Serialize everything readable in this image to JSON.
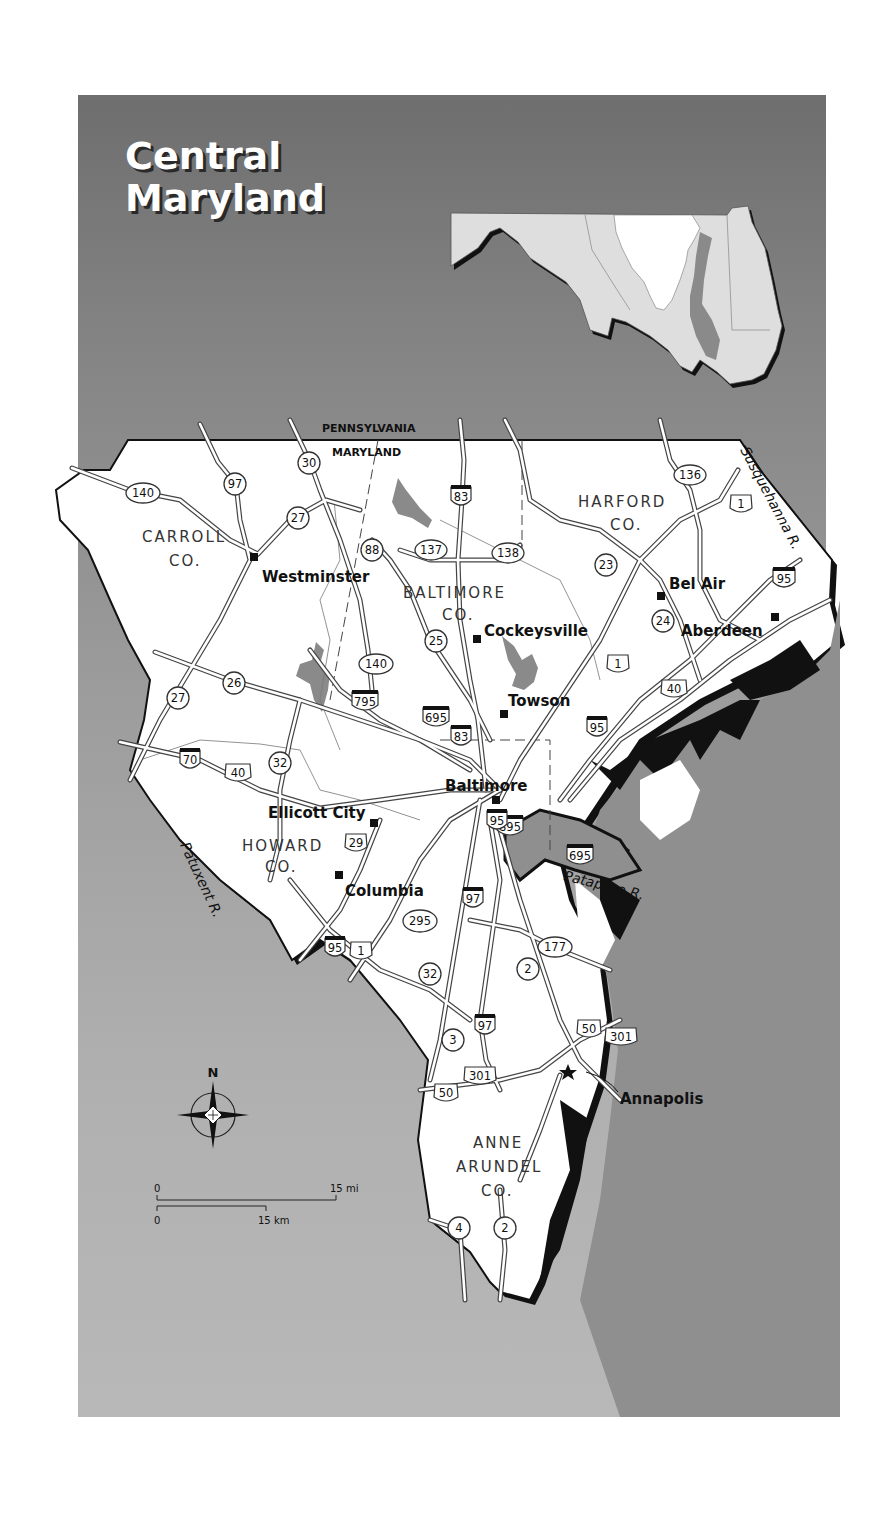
{
  "title": {
    "line1": "Central",
    "line2": "Maryland"
  },
  "colors": {
    "background_top": "#6e6e6e",
    "background_bottom": "#b8b8b8",
    "land": "#ffffff",
    "water": "#8a8a8a",
    "shadow": "#111111",
    "inset_land": "#e0e0e0",
    "inset_highlight": "#ffffff"
  },
  "border_labels": {
    "north": "PENNSYLVANIA",
    "south": "MARYLAND"
  },
  "counties": [
    {
      "name": "CARROLL",
      "suffix": "CO."
    },
    {
      "name": "BALTIMORE",
      "suffix": "CO."
    },
    {
      "name": "HARFORD",
      "suffix": "CO."
    },
    {
      "name": "HOWARD",
      "suffix": "CO."
    },
    {
      "name": "ANNE",
      "name2": "ARUNDEL",
      "suffix": "CO."
    }
  ],
  "cities": [
    {
      "name": "Westminster"
    },
    {
      "name": "Cockeysville"
    },
    {
      "name": "Bel Air"
    },
    {
      "name": "Aberdeen"
    },
    {
      "name": "Towson"
    },
    {
      "name": "Baltimore"
    },
    {
      "name": "Ellicott City"
    },
    {
      "name": "Columbia"
    },
    {
      "name": "Annapolis",
      "capital": true
    }
  ],
  "rivers": [
    {
      "name": "Susquehanna R."
    },
    {
      "name": "Patuxent R."
    },
    {
      "name": "Patapsco R."
    }
  ],
  "routes": {
    "interstate": [
      "83",
      "95",
      "70",
      "795",
      "695",
      "83",
      "95",
      "895",
      "97",
      "695",
      "95"
    ],
    "us": [
      "1",
      "40",
      "40",
      "29",
      "1",
      "50",
      "301",
      "301",
      "50"
    ],
    "state": [
      "140",
      "97",
      "30",
      "27",
      "88",
      "137",
      "138",
      "136",
      "23",
      "24",
      "25",
      "140",
      "26",
      "27",
      "32",
      "295",
      "32",
      "177",
      "2",
      "3",
      "4",
      "2"
    ]
  },
  "compass": {
    "north_label": "N"
  },
  "scale": {
    "miles_start": "0",
    "miles_end": "15 mi",
    "km_start": "0",
    "km_end": "15 km"
  }
}
